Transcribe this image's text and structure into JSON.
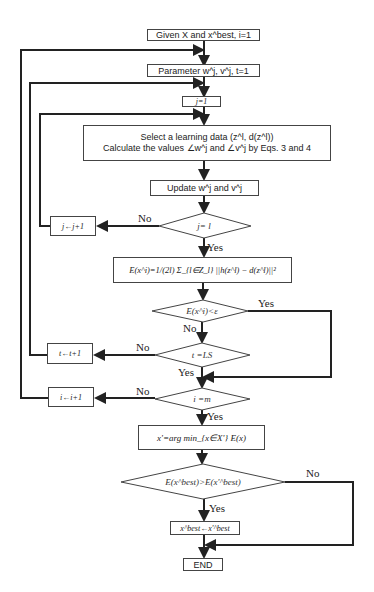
{
  "flowchart": {
    "start": "Given X and x^best, i=1",
    "param": "Parameter w^j, v^j, t=1",
    "j_init": "j=1",
    "select_line1": "Select a learning data (z^l, d(z^l))",
    "select_line2": "Calculate the values ∠w^j and ∠v^j by Eqs. 3 and 4",
    "update": "Update w^j and v^j",
    "cond_j": "j= l",
    "j_inc": "j←j+1",
    "error_eq": "E(x^i)=1/(2l) Σ_{l∈Z_l} ||h(z^l) − d(z^l)||²",
    "cond_err": "E(x^i)<ε",
    "cond_t": "t =LS",
    "t_inc": "t←t+1",
    "cond_i": "i =m",
    "i_inc": "i←i+1",
    "argmin": "x'=arg min_{x∈X'} E(x)",
    "cond_best": "E(x^best)>E(x'^best)",
    "assign_best": "x^best←x'^best",
    "end": "END"
  },
  "labels": {
    "yes": "Yes",
    "no": "No"
  },
  "colors": {
    "line": "#222222",
    "box_border": "#444444",
    "background": "#ffffff"
  }
}
